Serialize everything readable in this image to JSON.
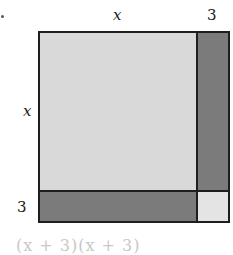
{
  "diagram": {
    "labels": {
      "top_x": "x",
      "top_3": "3",
      "left_x": "x",
      "left_3": "3"
    },
    "regions": [
      {
        "name": "x-squared",
        "color": "#d9d9d9"
      },
      {
        "name": "right-strip-3x",
        "color": "#7b7b7b"
      },
      {
        "name": "bottom-strip-3x",
        "color": "#7b7b7b"
      },
      {
        "name": "small-square-9",
        "color": "#e4e4e4"
      }
    ],
    "caption": "(x + 3)(x + 3)",
    "colors": {
      "border": "#1e1e1e",
      "light_fill": "#d9d9d9",
      "dark_fill": "#7b7b7b",
      "corner_fill": "#e4e4e4"
    }
  }
}
